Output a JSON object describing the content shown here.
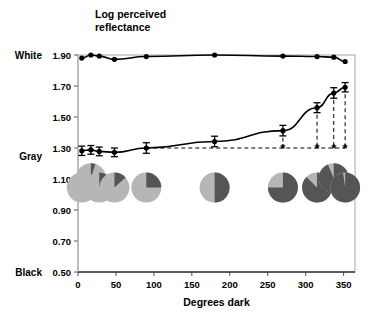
{
  "chart_data": {
    "type": "line",
    "title_lines": [
      "Log perceived",
      "reflectance"
    ],
    "xlabel": "Degrees dark",
    "ylabel": "Log perceived reflectance",
    "xlim": [
      0,
      365
    ],
    "ylim": [
      0.5,
      1.9
    ],
    "xticks": [
      0,
      50,
      100,
      150,
      200,
      250,
      300,
      350
    ],
    "xticklabels": [
      "0",
      "50",
      "100",
      "150",
      "200",
      "250",
      "300",
      "350"
    ],
    "yticks": [
      0.5,
      0.7,
      0.9,
      1.1,
      1.3,
      1.5,
      1.7,
      1.9
    ],
    "yticklabels": [
      "0.50",
      "0.70",
      "0.90",
      "1.10",
      "1.30",
      "1.50",
      "1.70",
      "1.90"
    ],
    "grid": false,
    "legend": "none",
    "anchor_labels": [
      {
        "text": "White",
        "y": 1.9
      },
      {
        "text": "Gray",
        "y": 1.25
      },
      {
        "text": "Black",
        "y": 0.5
      }
    ],
    "series": [
      {
        "name": "White target",
        "marker": "filled-circle",
        "color": "#000000",
        "x": [
          5,
          17,
          28,
          48,
          90,
          180,
          270,
          315,
          337,
          352
        ],
        "values": [
          1.88,
          1.9,
          1.893,
          1.872,
          1.89,
          1.9,
          1.893,
          1.89,
          1.886,
          1.858
        ],
        "errors": [
          0,
          0,
          0,
          0,
          0,
          0,
          0,
          0,
          0,
          0
        ]
      },
      {
        "name": "Gray target",
        "marker": "filled-circle",
        "color": "#000000",
        "x": [
          5,
          17,
          28,
          48,
          90,
          180,
          270,
          315,
          337,
          352
        ],
        "values": [
          1.282,
          1.288,
          1.278,
          1.272,
          1.3,
          1.342,
          1.412,
          1.56,
          1.655,
          1.692
        ],
        "errors": [
          0.03,
          0.028,
          0.028,
          0.028,
          0.034,
          0.034,
          0.034,
          0.032,
          0.034,
          0.03
        ]
      }
    ],
    "reference_line": {
      "y": 1.3,
      "style": "dashed",
      "x_from": 90,
      "x_to": 352
    },
    "drop_lines": [
      {
        "x": 270,
        "y": 1.412
      },
      {
        "x": 315,
        "y": 1.56
      },
      {
        "x": 337,
        "y": 1.655
      },
      {
        "x": 352,
        "y": 1.692
      }
    ],
    "annotations": [
      {
        "text": "*",
        "x": 270,
        "y": 1.265
      },
      {
        "text": "*",
        "x": 315,
        "y": 1.265
      },
      {
        "text": "*",
        "x": 337,
        "y": 1.265
      },
      {
        "text": "*",
        "x": 352,
        "y": 1.265
      }
    ],
    "pie_icons": [
      {
        "x": 5,
        "y": 1.045,
        "dark_degrees": 5,
        "radius": 15
      },
      {
        "x": 17,
        "y": 1.105,
        "dark_degrees": 17,
        "radius": 15
      },
      {
        "x": 28,
        "y": 1.045,
        "dark_degrees": 28,
        "radius": 15
      },
      {
        "x": 48,
        "y": 1.045,
        "dark_degrees": 48,
        "radius": 15
      },
      {
        "x": 90,
        "y": 1.045,
        "dark_degrees": 90,
        "radius": 15
      },
      {
        "x": 180,
        "y": 1.045,
        "dark_degrees": 180,
        "radius": 15
      },
      {
        "x": 270,
        "y": 1.045,
        "dark_degrees": 270,
        "radius": 15
      },
      {
        "x": 315,
        "y": 1.045,
        "dark_degrees": 315,
        "radius": 15
      },
      {
        "x": 337,
        "y": 1.105,
        "dark_degrees": 337,
        "radius": 15
      },
      {
        "x": 352,
        "y": 1.045,
        "dark_degrees": 352,
        "radius": 15
      }
    ],
    "pie_colors": {
      "light": "#b6b6b6",
      "dark": "#555555"
    }
  }
}
